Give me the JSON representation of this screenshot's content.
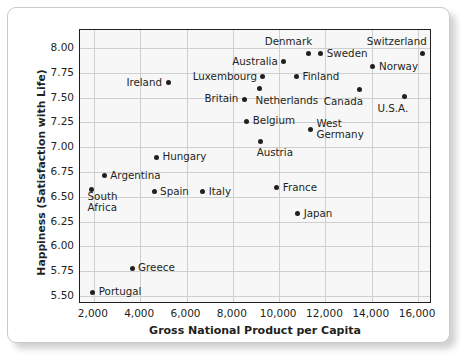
{
  "chart_data": {
    "type": "scatter",
    "title": "",
    "xlabel": "Gross National Product per Capita",
    "ylabel": "Happiness (Satisfaction with Life)",
    "xlim": [
      1400,
      16600
    ],
    "ylim": [
      5.42,
      8.18
    ],
    "grid": true,
    "legend": "none",
    "xticks": [
      "2,000",
      "4,000",
      "6,000",
      "8,000",
      "10,000",
      "12,000",
      "14,000",
      "16,000"
    ],
    "xtick_values": [
      2000,
      4000,
      6000,
      8000,
      10000,
      12000,
      14000,
      16000
    ],
    "yticks": [
      "5.50",
      "5.75",
      "6.00",
      "6.25",
      "6.50",
      "6.75",
      "7.00",
      "7.25",
      "7.50",
      "7.75",
      "8.00"
    ],
    "ytick_values": [
      5.5,
      5.75,
      6.0,
      6.25,
      6.5,
      6.75,
      7.0,
      7.25,
      7.5,
      7.75,
      8.0
    ],
    "marker_color": "#231f20",
    "plot_background": "#f7f7f7",
    "points": [
      {
        "label": "Portugal",
        "x": 1950,
        "y": 5.54,
        "label_side": "right"
      },
      {
        "label": "Greece",
        "x": 3650,
        "y": 5.78,
        "label_side": "right"
      },
      {
        "label": "South\nAfrica",
        "x": 1900,
        "y": 6.57,
        "label_side": "right-below"
      },
      {
        "label": "Argentina",
        "x": 2450,
        "y": 6.71,
        "label_side": "right"
      },
      {
        "label": "Spain",
        "x": 4600,
        "y": 6.55,
        "label_side": "right"
      },
      {
        "label": "Italy",
        "x": 6700,
        "y": 6.55,
        "label_side": "right"
      },
      {
        "label": "Hungary",
        "x": 4700,
        "y": 6.9,
        "label_side": "right"
      },
      {
        "label": "Ireland",
        "x": 5200,
        "y": 7.65,
        "label_side": "left"
      },
      {
        "label": "Britain",
        "x": 8500,
        "y": 7.48,
        "label_side": "left"
      },
      {
        "label": "Belgium",
        "x": 8600,
        "y": 7.26,
        "label_side": "right"
      },
      {
        "label": "Austria",
        "x": 9200,
        "y": 7.06,
        "label_side": "right-below"
      },
      {
        "label": "Netherlands",
        "x": 9150,
        "y": 7.59,
        "label_side": "right-below"
      },
      {
        "label": "Luxembourg",
        "x": 9300,
        "y": 7.71,
        "label_side": "left"
      },
      {
        "label": "France",
        "x": 9900,
        "y": 6.59,
        "label_side": "right"
      },
      {
        "label": "Japan",
        "x": 10800,
        "y": 6.33,
        "label_side": "right"
      },
      {
        "label": "Australia",
        "x": 10200,
        "y": 7.86,
        "label_side": "left"
      },
      {
        "label": "Denmark",
        "x": 11250,
        "y": 7.94,
        "label_side": "left-above"
      },
      {
        "label": "Finland",
        "x": 10750,
        "y": 7.71,
        "label_side": "right"
      },
      {
        "label": "Sweden",
        "x": 11800,
        "y": 7.94,
        "label_side": "right"
      },
      {
        "label": "West\nGermany",
        "x": 11350,
        "y": 7.18,
        "label_side": "right"
      },
      {
        "label": "Canada",
        "x": 13450,
        "y": 7.58,
        "label_side": "left-below"
      },
      {
        "label": "Norway",
        "x": 14050,
        "y": 7.81,
        "label_side": "right"
      },
      {
        "label": "U.S.A.",
        "x": 15400,
        "y": 7.51,
        "label_side": "left-below"
      },
      {
        "label": "Switzerland",
        "x": 16200,
        "y": 7.94,
        "label_side": "left-above"
      }
    ]
  }
}
